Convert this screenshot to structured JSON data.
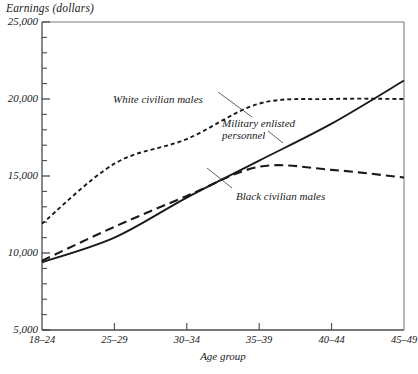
{
  "chart_data": {
    "type": "line",
    "title": "",
    "ylabel": "Earnings (dollars)",
    "xlabel": "Age group",
    "categories": [
      "18–24",
      "25–29",
      "30–34",
      "35–39",
      "40–44",
      "45–49"
    ],
    "ylim": [
      5000,
      25000
    ],
    "ytick_labels": [
      "5,000",
      "10,000",
      "15,000",
      "20,000",
      "25,000"
    ],
    "ytick_values": [
      5000,
      10000,
      15000,
      20000,
      25000
    ],
    "minor_tick_step": 1000,
    "grid": false,
    "legend": "inline-annotations",
    "series": [
      {
        "name": "White civilian males",
        "style": "dotted",
        "values": [
          11900,
          15800,
          17400,
          19700,
          20000,
          20000
        ]
      },
      {
        "name": "Military enlisted personnel",
        "style": "solid",
        "values": [
          9400,
          11000,
          13600,
          16000,
          18400,
          21200
        ]
      },
      {
        "name": "Black civilian males",
        "style": "dashed",
        "values": [
          9500,
          11700,
          13700,
          15600,
          15400,
          14900
        ]
      }
    ],
    "annotations": [
      {
        "text": "White civilian males",
        "x": 113,
        "y": 93
      },
      {
        "text": "Military enlisted",
        "x": 222,
        "y": 117
      },
      {
        "text": "personnel",
        "x": 222,
        "y": 129
      },
      {
        "text": "Black civilian males",
        "x": 236,
        "y": 190
      }
    ]
  },
  "axis": {
    "y_title": "Earnings (dollars)",
    "x_title": "Age group"
  },
  "colors": {
    "axis": "#4a4a4a",
    "ink": "#1a1a1a",
    "background": "#ffffff"
  },
  "source_note": ""
}
